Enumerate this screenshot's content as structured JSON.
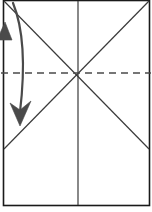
{
  "diagram": {
    "canvas": {
      "width": 152,
      "height": 212,
      "background": "#ffffff"
    },
    "colors": {
      "stroke": "#2b2b2b",
      "sheet_outline": "#1a1a1a",
      "crease_solid": "#3a3a3a",
      "crease_dashed": "#4a4a4a",
      "arrow": "#4a4a4a",
      "background": "#ffffff"
    },
    "sheet": {
      "label": "paper-sheet",
      "x": 3.5,
      "y": 0.5,
      "width": 146,
      "height": 205,
      "stroke_width": 1.6
    },
    "creases": [
      {
        "name": "diagonal-top-left-to-right-edge",
        "type": "solid",
        "x1": 4,
        "y1": 1,
        "x2": 149,
        "y2": 149,
        "stroke_width": 1.2
      },
      {
        "name": "diagonal-top-right-to-left-edge",
        "type": "solid",
        "x1": 149,
        "y1": 1,
        "x2": 4,
        "y2": 149,
        "stroke_width": 1.2
      },
      {
        "name": "vertical-center-crease",
        "type": "solid",
        "x1": 78,
        "y1": 1,
        "x2": 78,
        "y2": 205,
        "stroke_width": 1.2
      },
      {
        "name": "horizontal-valley-fold-line",
        "type": "dashed",
        "x1": 1,
        "y1": 73,
        "x2": 151,
        "y2": 73,
        "stroke_width": 1.3,
        "dash_pattern": "7 5"
      }
    ],
    "arrows": [
      {
        "name": "fold-down-curved-arrow",
        "path": "M 13 3 C 24 30, 25 70, 20 112",
        "stroke_width": 2.2,
        "head": {
          "name": "arrowhead-down",
          "points": "20,126 10,103 20,110 31,101",
          "direction": "down",
          "tip_x": 20,
          "tip_y": 126
        }
      },
      {
        "name": "edge-return-arrowhead",
        "head": {
          "name": "arrowhead-up",
          "points": "5,22 12,40 -3,40",
          "direction": "up",
          "tip_x": 5,
          "tip_y": 22
        }
      }
    ]
  }
}
